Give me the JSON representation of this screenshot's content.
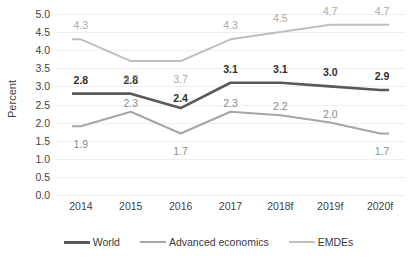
{
  "chart_data": {
    "type": "line",
    "title": "",
    "xlabel": "",
    "ylabel": "Percent",
    "ylim": [
      0.0,
      5.0
    ],
    "ytick_step": 0.5,
    "grid": true,
    "legend_position": "bottom",
    "categories": [
      "2014",
      "2015",
      "2016",
      "2017",
      "2018f",
      "2019f",
      "2020f"
    ],
    "yticks": [
      "0.0",
      "0.5",
      "1.0",
      "1.5",
      "2.0",
      "2.5",
      "3.0",
      "3.5",
      "4.0",
      "4.5",
      "5.0"
    ],
    "series": [
      {
        "name": "World",
        "color": "#595959",
        "values": [
          2.8,
          2.8,
          2.4,
          3.1,
          3.1,
          3.0,
          2.9
        ],
        "labels": [
          "2.8",
          "2.8",
          "2.4",
          "3.1",
          "3.1",
          "3.0",
          "2.9"
        ]
      },
      {
        "name": "Advanced economics",
        "color": "#a6a6a6",
        "values": [
          1.9,
          2.3,
          1.7,
          2.3,
          2.2,
          2.0,
          1.7
        ],
        "labels": [
          "1.9",
          "2.3",
          "1.7",
          "2.3",
          "2.2",
          "2.0",
          "1.7"
        ]
      },
      {
        "name": "EMDEs",
        "color": "#bfbfbf",
        "values": [
          4.3,
          3.7,
          3.7,
          4.3,
          4.5,
          4.7,
          4.7
        ],
        "labels": [
          "4.3",
          "3.7",
          "3.7",
          "4.3",
          "4.5",
          "4.7",
          "4.7"
        ]
      }
    ]
  },
  "legend": {
    "items": [
      {
        "label": "World"
      },
      {
        "label": "Advanced economics"
      },
      {
        "label": "EMDEs"
      }
    ]
  }
}
